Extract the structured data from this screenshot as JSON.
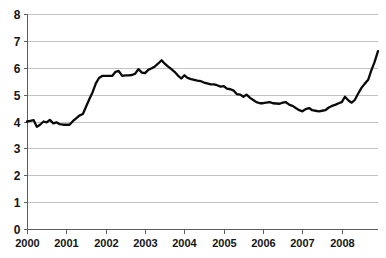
{
  "chart_data": {
    "type": "line",
    "title": "",
    "subtitle": "",
    "xlabel": "",
    "ylabel": "",
    "xlim": [
      2000,
      2008.92
    ],
    "ylim": [
      0,
      8
    ],
    "grid": true,
    "legend": null,
    "legend_position": "none",
    "y_ticks": [
      "0",
      "1",
      "2",
      "3",
      "4",
      "5",
      "6",
      "7",
      "8"
    ],
    "y_tick_values": [
      0,
      1,
      2,
      3,
      4,
      5,
      6,
      7,
      8
    ],
    "x_ticks": [
      "2000",
      "2001",
      "2002",
      "2003",
      "2004",
      "2005",
      "2006",
      "2007",
      "2008"
    ],
    "x_tick_values": [
      2000,
      2001,
      2002,
      2003,
      2004,
      2005,
      2006,
      2007,
      2008
    ],
    "series": [
      {
        "name": "rate",
        "color": "#0a0a0a",
        "x": [
          2000.0,
          2000.08,
          2000.17,
          2000.25,
          2000.33,
          2000.42,
          2000.5,
          2000.58,
          2000.67,
          2000.75,
          2000.83,
          2000.92,
          2001.0,
          2001.08,
          2001.17,
          2001.25,
          2001.33,
          2001.42,
          2001.5,
          2001.58,
          2001.67,
          2001.75,
          2001.83,
          2001.92,
          2002.0,
          2002.08,
          2002.17,
          2002.25,
          2002.33,
          2002.42,
          2002.5,
          2002.58,
          2002.67,
          2002.75,
          2002.83,
          2002.92,
          2003.0,
          2003.08,
          2003.17,
          2003.25,
          2003.33,
          2003.42,
          2003.5,
          2003.58,
          2003.67,
          2003.75,
          2003.83,
          2003.92,
          2004.0,
          2004.08,
          2004.17,
          2004.25,
          2004.33,
          2004.42,
          2004.5,
          2004.58,
          2004.67,
          2004.75,
          2004.83,
          2004.92,
          2005.0,
          2005.08,
          2005.17,
          2005.25,
          2005.33,
          2005.42,
          2005.5,
          2005.58,
          2005.67,
          2005.75,
          2005.83,
          2005.92,
          2006.0,
          2006.08,
          2006.17,
          2006.25,
          2006.33,
          2006.42,
          2006.5,
          2006.58,
          2006.67,
          2006.75,
          2006.83,
          2006.92,
          2007.0,
          2007.08,
          2007.17,
          2007.25,
          2007.33,
          2007.42,
          2007.5,
          2007.58,
          2007.67,
          2007.75,
          2007.83,
          2007.92,
          2008.0,
          2008.08,
          2008.17,
          2008.25,
          2008.33,
          2008.42,
          2008.5,
          2008.58,
          2008.67,
          2008.75,
          2008.83,
          2008.92
        ],
        "values": [
          4.0,
          4.02,
          4.05,
          3.8,
          3.88,
          4.0,
          3.97,
          4.06,
          3.93,
          3.97,
          3.9,
          3.88,
          3.88,
          3.88,
          4.02,
          4.12,
          4.22,
          4.28,
          4.55,
          4.82,
          5.1,
          5.42,
          5.62,
          5.7,
          5.7,
          5.7,
          5.7,
          5.85,
          5.88,
          5.7,
          5.72,
          5.72,
          5.73,
          5.78,
          5.95,
          5.82,
          5.8,
          5.92,
          5.98,
          6.05,
          6.15,
          6.28,
          6.15,
          6.05,
          5.95,
          5.85,
          5.72,
          5.6,
          5.72,
          5.62,
          5.58,
          5.55,
          5.52,
          5.5,
          5.45,
          5.42,
          5.38,
          5.38,
          5.35,
          5.3,
          5.32,
          5.22,
          5.2,
          5.15,
          5.02,
          5.0,
          4.92,
          5.0,
          4.88,
          4.8,
          4.72,
          4.68,
          4.68,
          4.7,
          4.72,
          4.68,
          4.67,
          4.66,
          4.7,
          4.72,
          4.62,
          4.58,
          4.5,
          4.42,
          4.38,
          4.46,
          4.5,
          4.42,
          4.4,
          4.38,
          4.4,
          4.42,
          4.52,
          4.58,
          4.62,
          4.68,
          4.72,
          4.92,
          4.78,
          4.7,
          4.8,
          5.05,
          5.25,
          5.4,
          5.55,
          5.9,
          6.2,
          6.62
        ]
      }
    ]
  },
  "plot": {
    "left": 27,
    "right": 378,
    "top": 14,
    "bottom": 229
  }
}
